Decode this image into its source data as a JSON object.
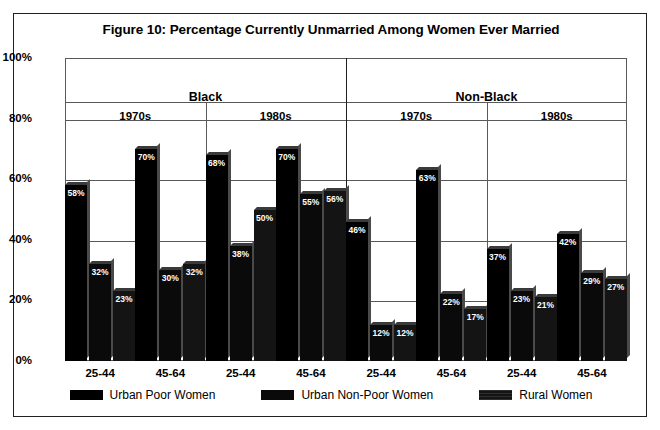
{
  "chart_data": {
    "type": "bar",
    "title": "Figure 10: Percentage Currently Unmarried Among Women Ever Married",
    "xlabel": "",
    "ylabel": "",
    "ylim": [
      0,
      100
    ],
    "ytick_labels": [
      "0%",
      "20%",
      "40%",
      "60%",
      "80%",
      "100%"
    ],
    "ytick_values": [
      0,
      20,
      40,
      60,
      80,
      100
    ],
    "grid": true,
    "legend_position": "bottom",
    "categories": [
      "25-44",
      "45-64",
      "25-44",
      "45-64",
      "25-44",
      "45-64",
      "25-44",
      "45-64"
    ],
    "series": [
      {
        "name": "Urban Poor Women",
        "values": [
          58,
          70,
          68,
          70,
          46,
          63,
          37,
          42
        ]
      },
      {
        "name": "Urban Non-Poor Women",
        "values": [
          32,
          30,
          38,
          55,
          12,
          22,
          23,
          29
        ]
      },
      {
        "name": "Rural Women",
        "values": [
          23,
          32,
          50,
          56,
          12,
          17,
          21,
          27
        ]
      }
    ],
    "value_labels": [
      [
        "58%",
        "70%",
        "68%",
        "70%",
        "46%",
        "63%",
        "37%",
        "42%"
      ],
      [
        "32%",
        "30%",
        "38%",
        "55%",
        "12%",
        "22%",
        "23%",
        "29%"
      ],
      [
        "23%",
        "32%",
        "50%",
        "56%",
        "12%",
        "17%",
        "21%",
        "27%"
      ]
    ],
    "groups": [
      {
        "race": "Black",
        "decades": [
          {
            "decade": "1970s",
            "ages": [
              "25-44",
              "45-64"
            ]
          },
          {
            "decade": "1980s",
            "ages": [
              "25-44",
              "45-64"
            ]
          }
        ]
      },
      {
        "race": "Non-Black",
        "decades": [
          {
            "decade": "1970s",
            "ages": [
              "25-44",
              "45-64"
            ]
          },
          {
            "decade": "1980s",
            "ages": [
              "25-44",
              "45-64"
            ]
          }
        ]
      }
    ]
  },
  "legend": {
    "items": [
      {
        "label": "Urban Poor Women",
        "color": "#000000"
      },
      {
        "label": "Urban Non-Poor Women",
        "color": "#0a0a0a"
      },
      {
        "label": "Rural Women",
        "color": "#141414"
      }
    ]
  },
  "colors": {
    "frame": "#231f20",
    "grid": "#58595b",
    "bar": "#000000",
    "label_text": "#ffffff",
    "background": "#ffffff"
  }
}
